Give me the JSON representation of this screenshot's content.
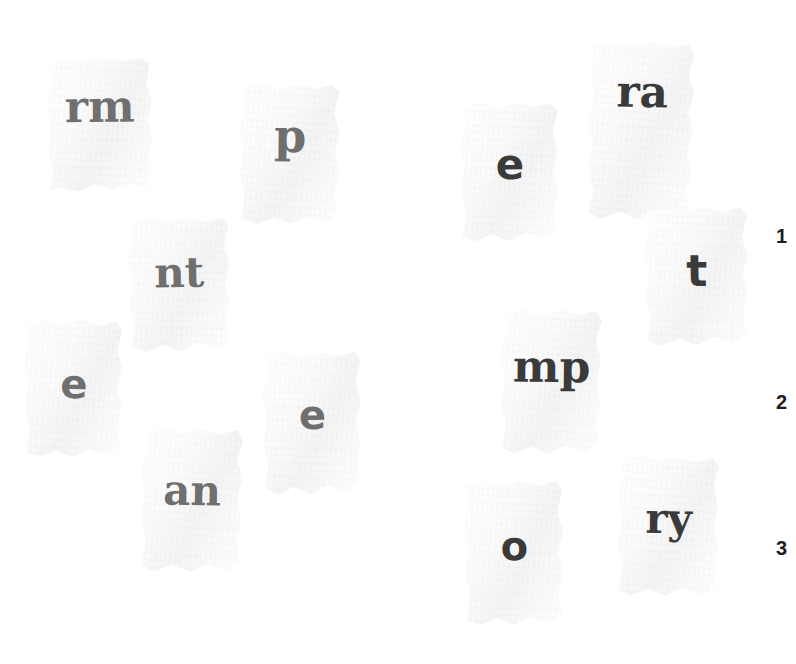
{
  "canvas": {
    "width": 796,
    "height": 664,
    "background": "#ffffff"
  },
  "palette": {
    "paper": "#fbfbfb",
    "paper_shade": "#f4f4f4",
    "ink_gray": "#6f6f6f",
    "ink_dark": "#3a3a3a",
    "row_number": "#1d1d1d",
    "shadow": "rgba(0,0,0,0.26)"
  },
  "groups": {
    "left": {
      "name": "left-fragment-group",
      "ink": "#6f6f6f"
    },
    "right": {
      "name": "right-fragment-group",
      "ink": "#3a3a3a"
    }
  },
  "scraps": [
    {
      "id": "scrap-rm",
      "text": "rm",
      "group": "left",
      "ink": "#6f6f6f",
      "typeface": "serif",
      "font_size": 44,
      "x": 47,
      "y": 57,
      "w": 106,
      "h": 137,
      "glyph_top": 28,
      "rotate": -0.6,
      "shape": "polygon(3% 4%, 17% 1%, 33% 3%, 52% 0%, 70% 3%, 88% 1%, 97% 5%, 94% 19%, 99% 33%, 95% 47%, 99% 61%, 95% 74%, 98% 87%, 93% 96%, 78% 92%, 62% 97%, 45% 93%, 28% 98%, 12% 95%, 2% 97%, 5% 82%, 1% 66%, 4% 50%, 0% 34%, 5% 19%)"
    },
    {
      "id": "scrap-p",
      "text": "p",
      "group": "left",
      "ink": "#6f6f6f",
      "typeface": "serif",
      "font_size": 46,
      "x": 239,
      "y": 83,
      "w": 102,
      "h": 143,
      "glyph_top": 30,
      "rotate": 0.8,
      "shape": "polygon(4% 3%, 20% 0%, 38% 4%, 56% 1%, 74% 4%, 90% 1%, 98% 6%, 93% 20%, 98% 35%, 94% 49%, 99% 63%, 94% 76%, 98% 89%, 86% 98%, 70% 93%, 52% 98%, 35% 94%, 18% 99%, 3% 95%, 6% 80%, 1% 64%, 5% 48%, 0% 33%, 5% 18%)"
    },
    {
      "id": "scrap-nt",
      "text": "nt",
      "group": "left",
      "ink": "#6f6f6f",
      "typeface": "serif",
      "font_size": 42,
      "x": 128,
      "y": 216,
      "w": 103,
      "h": 138,
      "glyph_top": 36,
      "rotate": -1.2,
      "shape": "polygon(5% 4%, 22% 0%, 40% 4%, 58% 1%, 76% 5%, 92% 2%, 98% 8%, 94% 22%, 99% 36%, 94% 50%, 98% 64%, 93% 78%, 97% 90%, 84% 97%, 67% 92%, 50% 98%, 33% 93%, 16% 98%, 2% 94%, 6% 79%, 1% 63%, 5% 47%, 0% 32%, 6% 17%)"
    },
    {
      "id": "scrap-e-left",
      "text": "e",
      "group": "left",
      "ink": "#6f6f6f",
      "typeface": "sans",
      "font_size": 40,
      "x": 24,
      "y": 320,
      "w": 100,
      "h": 140,
      "glyph_top": 44,
      "rotate": 0.4,
      "shape": "polygon(4% 3%, 21% 0%, 39% 3%, 57% 0%, 75% 4%, 91% 1%, 98% 7%, 93% 21%, 98% 34%, 93% 48%, 98% 62%, 93% 76%, 97% 89%, 83% 97%, 66% 92%, 49% 98%, 32% 93%, 15% 98%, 2% 94%, 6% 78%, 1% 62%, 5% 46%, 0% 31%, 5% 16%)"
    },
    {
      "id": "scrap-e-right-lower",
      "text": "e",
      "group": "left",
      "ink": "#6f6f6f",
      "typeface": "sans",
      "font_size": 40,
      "x": 262,
      "y": 351,
      "w": 101,
      "h": 146,
      "glyph_top": 44,
      "rotate": -0.5,
      "shape": "polygon(4% 3%, 22% 0%, 40% 4%, 58% 1%, 76% 4%, 92% 1%, 98% 7%, 93% 21%, 98% 35%, 93% 49%, 98% 63%, 93% 77%, 97% 90%, 82% 97%, 65% 92%, 48% 98%, 31% 93%, 14% 98%, 2% 93%, 6% 78%, 1% 62%, 5% 46%, 0% 31%, 5% 16%)"
    },
    {
      "id": "scrap-an",
      "text": "an",
      "group": "left",
      "ink": "#6f6f6f",
      "typeface": "serif",
      "font_size": 42,
      "x": 140,
      "y": 428,
      "w": 104,
      "h": 147,
      "glyph_top": 42,
      "rotate": 1.0,
      "shape": "polygon(5% 3%, 22% 0%, 40% 4%, 58% 1%, 76% 4%, 92% 1%, 98% 7%, 93% 21%, 98% 35%, 93% 49%, 98% 63%, 93% 77%, 97% 90%, 83% 97%, 66% 92%, 49% 98%, 32% 93%, 15% 98%, 2% 94%, 6% 78%, 1% 62%, 5% 46%, 0% 31%, 6% 16%)"
    },
    {
      "id": "scrap-e-top-right",
      "text": "e",
      "group": "right",
      "ink": "#3a3a3a",
      "typeface": "sans",
      "font_size": 42,
      "x": 460,
      "y": 102,
      "w": 100,
      "h": 142,
      "glyph_top": 42,
      "rotate": -0.4,
      "shape": "polygon(4% 3%, 21% 0%, 39% 4%, 57% 1%, 75% 4%, 91% 1%, 98% 7%, 93% 21%, 98% 35%, 93% 49%, 98% 63%, 93% 77%, 97% 90%, 83% 97%, 66% 92%, 49% 98%, 32% 93%, 15% 98%, 2% 94%, 6% 78%, 1% 62%, 5% 46%, 0% 31%, 5% 16%)"
    },
    {
      "id": "scrap-ra",
      "text": "ra",
      "group": "right",
      "ink": "#3a3a3a",
      "typeface": "serif",
      "font_size": 44,
      "x": 588,
      "y": 42,
      "w": 107,
      "h": 181,
      "glyph_top": 28,
      "rotate": 1.2,
      "shape": "polygon(4% 2%, 22% 0%, 40% 3%, 58% 0%, 76% 3%, 92% 1%, 98% 6%, 93% 17%, 98% 28%, 93% 39%, 98% 50%, 93% 61%, 97% 72%, 92% 82%, 97% 91%, 82% 97%, 65% 93%, 48% 98%, 31% 94%, 14% 98%, 2% 95%, 6% 82%, 1% 69%, 5% 56%, 0% 43%, 5% 30%, 1% 17%)"
    },
    {
      "id": "scrap-t",
      "text": "t",
      "group": "right",
      "ink": "#3a3a3a",
      "typeface": "sans",
      "font_size": 44,
      "x": 644,
      "y": 207,
      "w": 106,
      "h": 141,
      "glyph_top": 42,
      "rotate": -0.8,
      "shape": "polygon(4% 3%, 21% 0%, 39% 4%, 57% 1%, 75% 4%, 91% 1%, 98% 7%, 93% 21%, 98% 35%, 93% 49%, 98% 63%, 93% 77%, 97% 90%, 83% 97%, 66% 92%, 49% 98%, 32% 93%, 15% 98%, 2% 94%, 6% 78%, 1% 62%, 5% 46%, 0% 31%, 5% 16%)"
    },
    {
      "id": "scrap-mp",
      "text": "mp",
      "group": "right",
      "ink": "#3a3a3a",
      "typeface": "serif",
      "font_size": 44,
      "x": 500,
      "y": 309,
      "w": 103,
      "h": 148,
      "glyph_top": 36,
      "rotate": 0.6,
      "shape": "polygon(4% 3%, 22% 0%, 40% 4%, 58% 1%, 76% 4%, 92% 1%, 98% 7%, 93% 21%, 98% 35%, 93% 49%, 98% 63%, 93% 77%, 97% 90%, 82% 97%, 65% 92%, 48% 98%, 31% 93%, 14% 98%, 2% 94%, 6% 78%, 1% 62%, 5% 46%, 0% 31%, 5% 16%)"
    },
    {
      "id": "scrap-o",
      "text": "o",
      "group": "right",
      "ink": "#3a3a3a",
      "typeface": "sans",
      "font_size": 40,
      "x": 464,
      "y": 480,
      "w": 101,
      "h": 148,
      "glyph_top": 46,
      "rotate": -0.6,
      "shape": "polygon(4% 3%, 21% 0%, 39% 4%, 57% 1%, 75% 4%, 91% 1%, 98% 7%, 93% 21%, 98% 35%, 93% 49%, 98% 63%, 93% 77%, 97% 90%, 83% 97%, 66% 92%, 49% 98%, 32% 93%, 15% 98%, 2% 94%, 6% 78%, 1% 62%, 5% 46%, 0% 31%, 5% 16%)"
    },
    {
      "id": "scrap-ry",
      "text": "ry",
      "group": "right",
      "ink": "#3a3a3a",
      "typeface": "serif",
      "font_size": 42,
      "x": 617,
      "y": 456,
      "w": 103,
      "h": 143,
      "glyph_top": 42,
      "rotate": 0.9,
      "shape": "polygon(4% 3%, 22% 0%, 40% 4%, 58% 1%, 76% 4%, 92% 1%, 98% 7%, 93% 21%, 98% 35%, 93% 49%, 98% 63%, 93% 77%, 97% 90%, 82% 97%, 65% 92%, 48% 98%, 31% 93%, 14% 98%, 2% 94%, 6% 78%, 1% 62%, 5% 46%, 0% 31%, 5% 16%)"
    }
  ],
  "row_numbers": [
    {
      "id": "row-number-1",
      "label": "1",
      "x": 776,
      "y": 226
    },
    {
      "id": "row-number-2",
      "label": "2",
      "x": 776,
      "y": 392
    },
    {
      "id": "row-number-3",
      "label": "3",
      "x": 776,
      "y": 538
    }
  ]
}
